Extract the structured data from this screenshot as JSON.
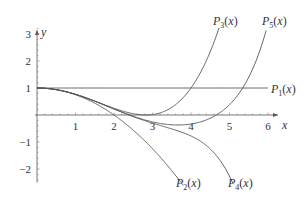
{
  "chart_data": {
    "type": "line",
    "title": "",
    "xlabel": "x",
    "ylabel": "y",
    "xlim": [
      0,
      6.3
    ],
    "ylim": [
      -2.5,
      3.3
    ],
    "grid": false,
    "x_ticks": [
      1,
      2,
      3,
      4,
      5,
      6
    ],
    "y_ticks": [
      -2,
      -1,
      1,
      2,
      3
    ],
    "x_tick_labels": [
      "1",
      "2",
      "3",
      "4",
      "5",
      "6"
    ],
    "y_tick_labels": [
      "−2",
      "−1",
      "1",
      "2",
      "3"
    ],
    "series": [
      {
        "name": "P1(x)",
        "label_base": "P",
        "label_sub": "1",
        "label_arg": "(x)",
        "coeffs": [
          1
        ],
        "x_end": 6.0
      },
      {
        "name": "P2(x)",
        "label_base": "P",
        "label_sub": "2",
        "label_arg": "(x)",
        "coeffs": [
          1,
          0,
          -0.25
        ],
        "x_end": 3.8
      },
      {
        "name": "P3(x)",
        "label_base": "P",
        "label_sub": "3",
        "label_arg": "(x)",
        "coeffs": [
          1,
          0,
          -0.25,
          0,
          0.015625
        ],
        "x_end": 4.73
      },
      {
        "name": "P4(x)",
        "label_base": "P",
        "label_sub": "4",
        "label_arg": "(x)",
        "coeffs": [
          1,
          0,
          -0.25,
          0,
          0.015625,
          0,
          -0.000434028
        ],
        "x_end": 5.09
      },
      {
        "name": "P5(x)",
        "label_base": "P",
        "label_sub": "5",
        "label_arg": "(x)",
        "coeffs": [
          1,
          0,
          -0.25,
          0,
          0.015625,
          0,
          -0.000434028,
          0,
          6.78168e-06
        ],
        "x_end": 5.95
      }
    ],
    "sample_points": {
      "P1(x)": [
        [
          0,
          1
        ],
        [
          3,
          1
        ],
        [
          6,
          1
        ]
      ],
      "P2(x)": [
        [
          0,
          1
        ],
        [
          1,
          0.75
        ],
        [
          2,
          0
        ],
        [
          3,
          -1.25
        ],
        [
          3.8,
          -2.61
        ]
      ],
      "P3(x)": [
        [
          0,
          1
        ],
        [
          1,
          0.77
        ],
        [
          2,
          0.25
        ],
        [
          3,
          0.02
        ],
        [
          4,
          1
        ],
        [
          4.73,
          3.2
        ]
      ],
      "P4(x)": [
        [
          0,
          1
        ],
        [
          1,
          0.77
        ],
        [
          2,
          0.22
        ],
        [
          3,
          -0.3
        ],
        [
          4,
          -0.78
        ],
        [
          5,
          -2.25
        ]
      ],
      "P5(x)": [
        [
          0,
          1
        ],
        [
          2,
          0.22
        ],
        [
          3,
          -0.25
        ],
        [
          4,
          -0.34
        ],
        [
          5,
          0.4
        ],
        [
          5.35,
          1.0
        ],
        [
          5.95,
          3.0
        ]
      ]
    }
  },
  "labels": {
    "x_axis": "x",
    "y_axis": "y"
  }
}
